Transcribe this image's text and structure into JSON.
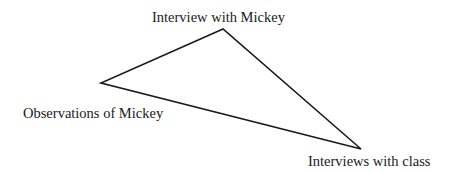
{
  "diagram": {
    "type": "triangulation",
    "shape": "triangle",
    "stroke_color": "#1a1a1a",
    "vertices": [
      {
        "id": "top",
        "label": "Interview with Mickey",
        "x": 223,
        "y": 29
      },
      {
        "id": "left",
        "label": "Observations of Mickey",
        "x": 101,
        "y": 83
      },
      {
        "id": "bottom-right",
        "label": "Interviews with class",
        "x": 361,
        "y": 149
      }
    ],
    "edges": [
      {
        "from": "top",
        "to": "left"
      },
      {
        "from": "left",
        "to": "bottom-right"
      },
      {
        "from": "bottom-right",
        "to": "top"
      }
    ]
  }
}
